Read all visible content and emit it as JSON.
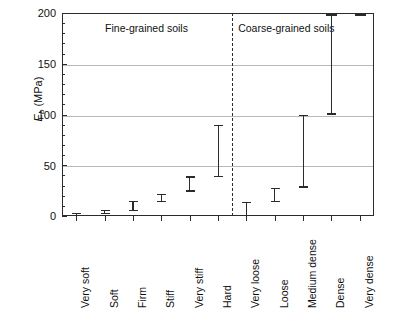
{
  "chart_data": {
    "type": "bar",
    "chart_subtype": "range-error-bars",
    "title": "",
    "xlabel": "",
    "ylabel": "E_b (MPa)",
    "ylabel_parts": {
      "symbol": "E",
      "subscript": "b",
      "unit": "(MPa)"
    },
    "ylim": [
      0,
      200
    ],
    "yticks": [
      0,
      50,
      100,
      150,
      200
    ],
    "ytick_labels": [
      "0",
      "50",
      "100",
      "150",
      "200"
    ],
    "yminor_step": 10,
    "grid": "horizontal",
    "legend": "none",
    "categories": [
      "Very soft",
      "Soft",
      "Firm",
      "Stiff",
      "Very stiff",
      "Hard",
      "Very loose",
      "Loose",
      "Medium dense",
      "Dense",
      "Very dense"
    ],
    "ranges": [
      {
        "category": "Very soft",
        "low": 0,
        "high": 3,
        "group": "Fine-grained soils",
        "clipped_high": false
      },
      {
        "category": "Soft",
        "low": 2,
        "high": 6,
        "group": "Fine-grained soils",
        "clipped_high": false
      },
      {
        "category": "Firm",
        "low": 5,
        "high": 15,
        "group": "Fine-grained soils",
        "clipped_high": false
      },
      {
        "category": "Stiff",
        "low": 14,
        "high": 22,
        "group": "Fine-grained soils",
        "clipped_high": false
      },
      {
        "category": "Very stiff",
        "low": 24,
        "high": 39,
        "group": "Fine-grained soils",
        "clipped_high": false
      },
      {
        "category": "Hard",
        "low": 38,
        "high": 90,
        "group": "Fine-grained soils",
        "clipped_high": false
      },
      {
        "category": "Very loose",
        "low": 0,
        "high": 14,
        "group": "Coarse-grained soils",
        "clipped_high": false
      },
      {
        "category": "Loose",
        "low": 14,
        "high": 28,
        "group": "Coarse-grained soils",
        "clipped_high": false
      },
      {
        "category": "Medium dense",
        "low": 28,
        "high": 100,
        "group": "Coarse-grained soils",
        "clipped_high": false
      },
      {
        "category": "Dense",
        "low": 100,
        "high": 200,
        "group": "Coarse-grained soils",
        "clipped_high": true
      },
      {
        "category": "Very dense",
        "low": 200,
        "high": 200,
        "group": "Coarse-grained soils",
        "clipped_high": true
      }
    ],
    "group_labels": [
      "Fine-grained soils",
      "Coarse-grained soils"
    ],
    "divider": {
      "after_category": "Hard",
      "style": "dashed"
    },
    "colors": {
      "axis": "#2b2b2b",
      "grid": "#b9b9b9",
      "bars": "#2b2b2b",
      "background": "#ffffff",
      "text": "#111111"
    }
  },
  "axis": {
    "y_title_symbol": "E",
    "y_title_sub": "b",
    "y_title_unit": " (MPa)",
    "ticks": [
      {
        "label": "200"
      },
      {
        "label": "150"
      },
      {
        "label": "100"
      },
      {
        "label": "50"
      },
      {
        "label": "0"
      }
    ]
  },
  "groups": [
    {
      "label": "Fine-grained soils"
    },
    {
      "label": "Coarse-grained soils"
    }
  ]
}
